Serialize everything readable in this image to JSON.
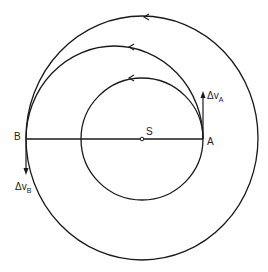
{
  "diagram": {
    "type": "hohmann-transfer-orbit",
    "labels": {
      "center": "S",
      "point_a": "A",
      "point_b": "B",
      "delta_v_a": "Δv",
      "delta_v_a_sub": "A",
      "delta_v_b": "Δv",
      "delta_v_b_sub": "B"
    },
    "colors": {
      "stroke": "#1a1a1a",
      "background": "#ffffff"
    },
    "geometry": {
      "sun": [
        142,
        139
      ],
      "inner_orbit_radius": 61,
      "outer_orbit_rx": 116,
      "outer_orbit_ry": 122,
      "transfer_center": [
        114.5,
        139
      ],
      "transfer_rx": 88.5,
      "transfer_ry": 93
    }
  }
}
